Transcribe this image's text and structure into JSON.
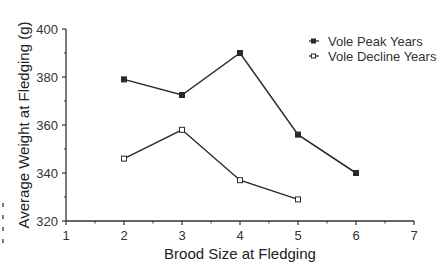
{
  "chart_data": {
    "type": "line",
    "title": "",
    "xlabel": "Brood Size at Fledging",
    "ylabel": "Average Weight at Fledging (g)",
    "xlim": [
      1,
      7
    ],
    "ylim": [
      320,
      400
    ],
    "x_ticks": [
      1,
      2,
      3,
      4,
      5,
      6,
      7
    ],
    "y_ticks": [
      320,
      340,
      360,
      380,
      400
    ],
    "grid": false,
    "legend_position": "top-right",
    "series": [
      {
        "name": "Vole Peak Years",
        "marker": "filled-square",
        "x": [
          2,
          3,
          4,
          5,
          6
        ],
        "values": [
          379,
          372.5,
          390,
          356,
          340
        ]
      },
      {
        "name": "Vole Decline Years",
        "marker": "open-square",
        "x": [
          2,
          3,
          4,
          5
        ],
        "values": [
          346,
          358,
          337,
          329
        ]
      }
    ]
  },
  "colors": {
    "line": "#2a2a2a",
    "axis": "#333333",
    "background": "#ffffff"
  }
}
